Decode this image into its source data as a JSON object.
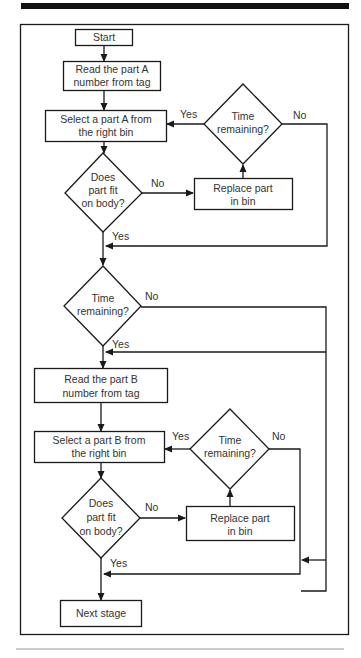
{
  "diagram": {
    "type": "flowchart",
    "nodes": {
      "start": {
        "label": "Start"
      },
      "read_a": {
        "line1": "Read the part A",
        "line2": "number from tag"
      },
      "select_a": {
        "line1": "Select a part A from",
        "line2": "the right bin"
      },
      "time_a": {
        "line1": "Time",
        "line2": "remaining?"
      },
      "fit_a": {
        "line1": "Does",
        "line2": "part fit",
        "line3": "on body?"
      },
      "replace_a": {
        "line1": "Replace part",
        "line2": "in bin"
      },
      "time_mid": {
        "line1": "Time",
        "line2": "remaining?"
      },
      "read_b": {
        "line1": "Read the part B",
        "line2": "number from tag"
      },
      "select_b": {
        "line1": "Select a part B from",
        "line2": "the right bin"
      },
      "time_b": {
        "line1": "Time",
        "line2": "remaining?"
      },
      "fit_b": {
        "line1": "Does",
        "line2": "part fit",
        "line3": "on body?"
      },
      "replace_b": {
        "line1": "Replace part",
        "line2": "in bin"
      },
      "next": {
        "label": "Next stage"
      }
    },
    "edge_labels": {
      "time_a_yes": "Yes",
      "time_a_no": "No",
      "fit_a_no": "No",
      "fit_a_yes": "Yes",
      "time_mid_no": "No",
      "time_mid_yes": "Yes",
      "time_b_yes": "Yes",
      "time_b_no": "No",
      "fit_b_no": "No",
      "fit_b_yes": "Yes"
    },
    "colors": {
      "stroke": "#1a1a1a",
      "text": "#333333",
      "rule": "#000000",
      "footer_rule": "#999999"
    }
  }
}
